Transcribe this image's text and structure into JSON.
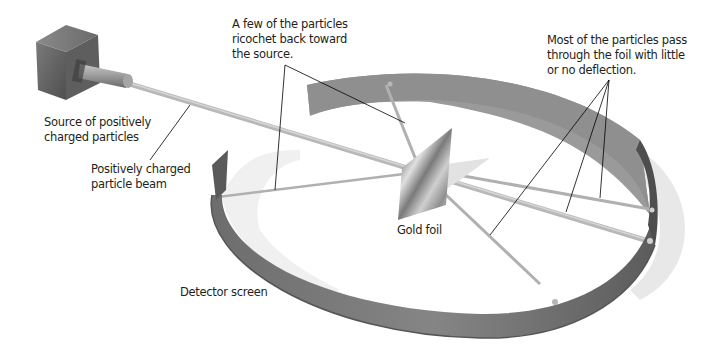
{
  "figure": {
    "labels": {
      "source": "Source of positively\ncharged particles",
      "beam": "Positively charged\nparticle beam",
      "ricochet": "A few of the particles\nricochet back toward\nthe source.",
      "pass_through": "Most of the particles pass\nthrough the foil with little\nor no deflection.",
      "gold_foil": "Gold foil",
      "detector": "Detector screen"
    },
    "colors": {
      "background": "#ffffff",
      "source_box": "#6b6b6b",
      "beam": "#b4b4b4",
      "detector_outer": "#7a7a7a",
      "detector_inner": "#9a9a9a",
      "detector_shadow": "#e6e6e6",
      "foil": "#a8a8a8",
      "leader_lines": "#000000",
      "text": "#231f20"
    }
  }
}
